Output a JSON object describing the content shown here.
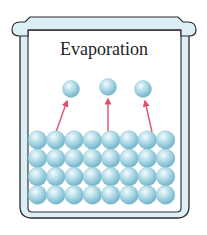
{
  "diagram": {
    "title": "Evaporation",
    "container": "beaker",
    "colors": {
      "glass_fill": "#dceff6",
      "glass_outline": "#2a2a2a",
      "sphere_light": "#eef8fb",
      "sphere_mid": "#a9d8e6",
      "sphere_dark": "#6fb5cc",
      "arrow": "#e0506e"
    },
    "liquid": {
      "rows": 4,
      "columns": 8
    },
    "vapor_molecules": [
      {
        "x": 71,
        "y": 89
      },
      {
        "x": 108,
        "y": 87
      },
      {
        "x": 143,
        "y": 89
      }
    ],
    "arrows": [
      {
        "from": [
          56,
          130
        ],
        "to": [
          67,
          101
        ]
      },
      {
        "from": [
          108,
          130
        ],
        "to": [
          108,
          100
        ]
      },
      {
        "from": [
          152,
          130
        ],
        "to": [
          145,
          101
        ]
      }
    ]
  }
}
